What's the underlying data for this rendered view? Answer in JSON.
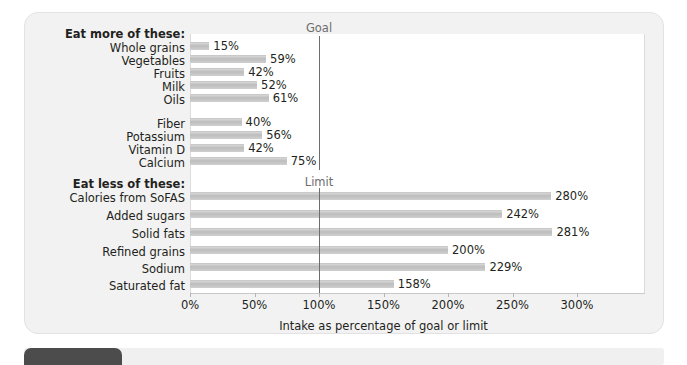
{
  "chart_data": {
    "type": "bar",
    "orientation": "horizontal",
    "title": "",
    "xlabel": "Intake as percentage of goal or limit",
    "ylabel": "",
    "xlim": [
      0,
      310
    ],
    "xticks": [
      "0%",
      "50%",
      "100%",
      "150%",
      "200%",
      "250%",
      "300%"
    ],
    "xtick_values": [
      0,
      50,
      100,
      150,
      200,
      250,
      300
    ],
    "grid": false,
    "legend": "none",
    "reference_lines": [
      {
        "label": "Goal",
        "value": 100
      },
      {
        "label": "Limit",
        "value": 100
      }
    ],
    "sections": [
      {
        "header": "Eat more of these:",
        "categories": [
          "Whole grains",
          "Vegetables",
          "Fruits",
          "Milk",
          "Oils"
        ],
        "values": [
          15,
          59,
          42,
          52,
          61
        ],
        "labels": [
          "15%",
          "59%",
          "42%",
          "52%",
          "61%"
        ]
      },
      {
        "header": "",
        "categories": [
          "Fiber",
          "Potassium",
          "Vitamin D",
          "Calcium"
        ],
        "values": [
          40,
          56,
          42,
          75
        ],
        "labels": [
          "40%",
          "56%",
          "42%",
          "75%"
        ]
      },
      {
        "header": "Eat less of these:",
        "categories": [
          "Calories from SoFAS",
          "Added sugars",
          "Solid fats",
          "Refined grains",
          "Sodium",
          "Saturated fat"
        ],
        "values": [
          280,
          242,
          281,
          200,
          229,
          158
        ],
        "labels": [
          "280%",
          "242%",
          "281%",
          "200%",
          "229%",
          "158%"
        ]
      }
    ],
    "categories": [
      "Whole grains",
      "Vegetables",
      "Fruits",
      "Milk",
      "Oils",
      "Fiber",
      "Potassium",
      "Vitamin D",
      "Calcium",
      "Calories from SoFAS",
      "Added sugars",
      "Solid fats",
      "Refined grains",
      "Sodium",
      "Saturated fat"
    ],
    "values": [
      15,
      59,
      42,
      52,
      61,
      40,
      56,
      42,
      75,
      280,
      242,
      281,
      200,
      229,
      158
    ],
    "bar_color": "#c4c4c4"
  },
  "chart": {
    "section_more_label": "Eat more of these:",
    "section_less_label": "Eat less of these:",
    "goal_label": "Goal",
    "limit_label": "Limit",
    "axis_title": "Intake as percentage of goal or limit",
    "rows": [
      {
        "name": "Whole grains",
        "value": "15%"
      },
      {
        "name": "Vegetables",
        "value": "59%"
      },
      {
        "name": "Fruits",
        "value": "42%"
      },
      {
        "name": "Milk",
        "value": "52%"
      },
      {
        "name": "Oils",
        "value": "61%"
      },
      {
        "name": "Fiber",
        "value": "40%"
      },
      {
        "name": "Potassium",
        "value": "56%"
      },
      {
        "name": "Vitamin D",
        "value": "42%"
      },
      {
        "name": "Calcium",
        "value": "75%"
      },
      {
        "name": "Calories from SoFAS",
        "value": "280%"
      },
      {
        "name": "Added sugars",
        "value": "242%"
      },
      {
        "name": "Solid fats",
        "value": "281%"
      },
      {
        "name": "Refined grains",
        "value": "200%"
      },
      {
        "name": "Sodium",
        "value": "229%"
      },
      {
        "name": "Saturated fat",
        "value": "158%"
      }
    ],
    "ticks": [
      "0%",
      "50%",
      "100%",
      "150%",
      "200%",
      "250%",
      "300%"
    ]
  },
  "colors": {
    "bar": "#c4c4c4",
    "card_bg": "#f2f2f2",
    "plot_bg": "#ffffff",
    "reference_line": "#6d6d6d",
    "text": "#231f20",
    "tab": "#4c4c4c"
  }
}
